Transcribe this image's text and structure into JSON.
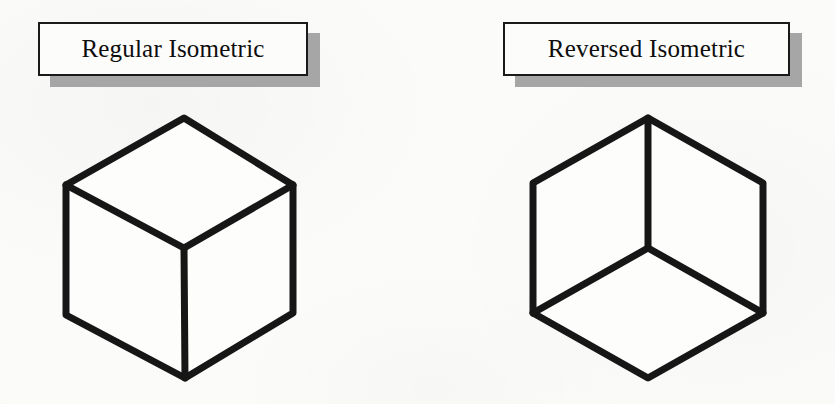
{
  "page": {
    "background_color": "#fbfbf9",
    "ink_color": "#161616",
    "shadow_color": "#a6a6a6"
  },
  "panels": [
    {
      "id": "regular",
      "label": "Regular Isometric",
      "figure": {
        "name": "isometric-cube-regular",
        "description": "Isometric cube seen from above: top face visible as a rhombus, vertex junction points downward from the centre",
        "outline_points": "66,185 184,118 293,185 293,313 185,378 66,315",
        "interior_edges": [
          "66,185 184,248 293,185",
          "184,248 185,378"
        ],
        "junction_point": "184,248",
        "junction_orientation": "down"
      }
    },
    {
      "id": "reversed",
      "label": "Reversed Isometric",
      "figure": {
        "name": "isometric-cube-reversed",
        "description": "Isometric cube seen from below: bottom face visible as a rhombus, vertex junction points upward from the centre",
        "outline_points": "533,183 648,118 763,183 763,313 648,378 533,313",
        "interior_edges": [
          "533,313 648,248 763,313",
          "648,248 648,118"
        ],
        "junction_point": "648,248",
        "junction_orientation": "up"
      }
    }
  ]
}
